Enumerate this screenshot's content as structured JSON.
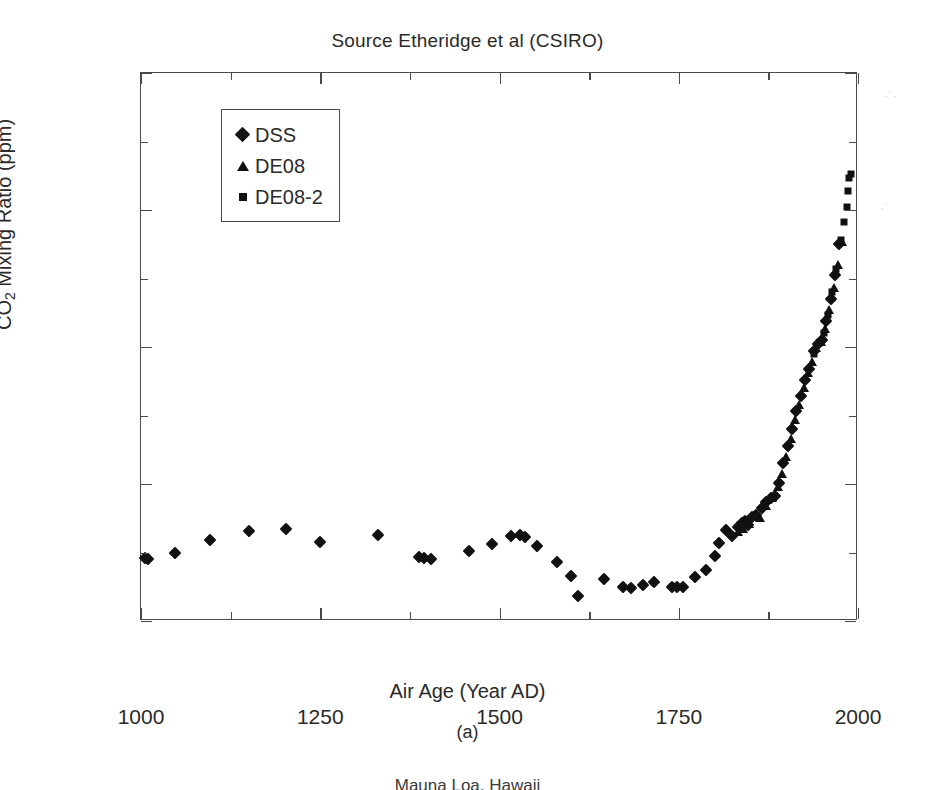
{
  "figure": {
    "title": "Source Etheridge et al (CSIRO)",
    "caption": "(a)",
    "bottom_fragment": "Mauna Loa, Hawaii"
  },
  "axes": {
    "x_title": "Air Age (Year AD)",
    "y_title_main": "CO",
    "y_title_sub": "2",
    "y_title_rest": " Mixing Ratio (ppm)",
    "x_ticks": [
      "1000",
      "1250",
      "1500",
      "1750",
      "2000"
    ],
    "y_ticks": [
      "350",
      "330",
      "310",
      "290",
      "270"
    ]
  },
  "legend": {
    "items": [
      {
        "label": "DSS",
        "marker": "diamond-marker"
      },
      {
        "label": "DE08",
        "marker": "triangle-marker"
      },
      {
        "label": "DE08-2",
        "marker": "square-marker"
      }
    ]
  },
  "chart_data": {
    "type": "scatter",
    "title": "Source Etheridge et al (CSIRO)",
    "xlabel": "Air Age (Year AD)",
    "ylabel": "CO2 Mixing Ratio (ppm)",
    "xlim": [
      1000,
      2000
    ],
    "ylim": [
      270,
      350
    ],
    "x_major_tick_interval": 250,
    "x_minor_tick_interval": 125,
    "y_major_tick_interval": 20,
    "y_minor_tick_interval": 10,
    "grid": false,
    "legend_position": "upper-left-inside",
    "marker_color": "#111111",
    "frame_color": "#4a4a4a",
    "series": [
      {
        "name": "DSS",
        "marker": "diamond",
        "points": [
          [
            1006,
            279.2
          ],
          [
            1010,
            279.0
          ],
          [
            1048,
            280.0
          ],
          [
            1096,
            281.8
          ],
          [
            1150,
            283.2
          ],
          [
            1202,
            283.4
          ],
          [
            1250,
            281.5
          ],
          [
            1330,
            282.5
          ],
          [
            1388,
            279.3
          ],
          [
            1395,
            279.2
          ],
          [
            1404,
            279.1
          ],
          [
            1458,
            280.2
          ],
          [
            1490,
            281.2
          ],
          [
            1516,
            282.4
          ],
          [
            1528,
            282.5
          ],
          [
            1536,
            282.2
          ],
          [
            1552,
            281.0
          ],
          [
            1580,
            278.6
          ],
          [
            1600,
            276.6
          ],
          [
            1610,
            273.6
          ],
          [
            1646,
            276.1
          ],
          [
            1672,
            274.9
          ],
          [
            1684,
            274.8
          ],
          [
            1700,
            275.3
          ],
          [
            1716,
            275.7
          ],
          [
            1740,
            274.9
          ],
          [
            1748,
            275.0
          ],
          [
            1756,
            274.9
          ],
          [
            1772,
            276.4
          ],
          [
            1788,
            277.5
          ],
          [
            1800,
            279.5
          ],
          [
            1806,
            281.4
          ],
          [
            1816,
            283.3
          ],
          [
            1824,
            282.4
          ],
          [
            1832,
            283.7
          ],
          [
            1838,
            284.3
          ],
          [
            1842,
            284.6
          ],
          [
            1846,
            284.0
          ],
          [
            1852,
            285.2
          ],
          [
            1858,
            285.5
          ],
          [
            1866,
            286.5
          ],
          [
            1872,
            287.3
          ],
          [
            1878,
            288.0
          ],
          [
            1884,
            288.3
          ],
          [
            1890,
            290.2
          ],
          [
            1896,
            293.0
          ],
          [
            1902,
            295.5
          ],
          [
            1908,
            298.0
          ],
          [
            1914,
            300.6
          ],
          [
            1920,
            302.8
          ],
          [
            1926,
            305.2
          ],
          [
            1932,
            306.8
          ],
          [
            1938,
            309.4
          ],
          [
            1944,
            310.4
          ],
          [
            1950,
            311.0
          ],
          [
            1956,
            313.8
          ],
          [
            1962,
            317.0
          ],
          [
            1968,
            320.5
          ],
          [
            1974,
            325.0
          ]
        ]
      },
      {
        "name": "DE08",
        "marker": "triangle",
        "points": [
          [
            1832,
            283.0
          ],
          [
            1840,
            283.5
          ],
          [
            1848,
            284.2
          ],
          [
            1856,
            285.4
          ],
          [
            1864,
            285.1
          ],
          [
            1872,
            286.8
          ],
          [
            1880,
            288.0
          ],
          [
            1888,
            289.5
          ],
          [
            1894,
            291.4
          ],
          [
            1900,
            294.0
          ],
          [
            1906,
            296.6
          ],
          [
            1912,
            299.4
          ],
          [
            1918,
            301.5
          ],
          [
            1924,
            304.0
          ],
          [
            1930,
            306.2
          ],
          [
            1936,
            307.8
          ],
          [
            1942,
            309.8
          ],
          [
            1948,
            310.8
          ],
          [
            1954,
            312.6
          ],
          [
            1960,
            315.4
          ],
          [
            1966,
            318.6
          ],
          [
            1972,
            322.0
          ],
          [
            1978,
            325.4
          ]
        ]
      },
      {
        "name": "DE08-2",
        "marker": "square",
        "points": [
          [
            1938,
            309.0
          ],
          [
            1946,
            310.6
          ],
          [
            1952,
            312.0
          ],
          [
            1958,
            314.6
          ],
          [
            1964,
            318.0
          ],
          [
            1970,
            321.4
          ],
          [
            1976,
            325.6
          ],
          [
            1980,
            328.2
          ],
          [
            1984,
            330.5
          ],
          [
            1986,
            332.8
          ],
          [
            1988,
            334.6
          ],
          [
            1990,
            335.2
          ]
        ]
      }
    ]
  }
}
